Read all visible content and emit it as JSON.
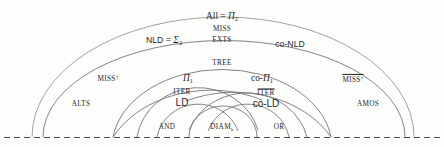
{
  "diagram": {
    "type": "nested-semicircle-hierarchy",
    "baseline_style": "dashed",
    "stroke_color": "#8a8a8a",
    "text_color": "#1f1f1f",
    "background": "#fdfdfc"
  },
  "labels": {
    "all_pi2": "All = Π2",
    "all_pi2_parts": {
      "name": "All",
      "rel": "=",
      "sym": "Π",
      "sub": "2"
    },
    "miss": "MISS",
    "exts": "EXTS",
    "nld_sigma2": "NLD = Σ2",
    "nld_parts": {
      "name": "NLD",
      "rel": "=",
      "sym": "Σ",
      "sub": "2"
    },
    "co_nld": "co-NLD",
    "tree": "TREE",
    "pi1": "Π1",
    "pi1_parts": {
      "sym": "Π",
      "sub": "1"
    },
    "co_pi1": "co-Π1",
    "co_pi1_parts": {
      "prefix": "co-",
      "sym": "Π",
      "sub": "1"
    },
    "miss_dagger": "MISS†",
    "miss_dagger_parts": {
      "base": "MISS",
      "sup": "†"
    },
    "miss_dagger_bar": "MISS† (overlined)",
    "alts": "ALTS",
    "amos": "AMOS",
    "iter": "ITER",
    "ld": "LD",
    "iter_bar": "ITER (overlined)",
    "co_ld": "co-LD",
    "and": "AND",
    "diam_k": "DIAMk",
    "diam_parts": {
      "base": "DIAM",
      "sub": "k"
    },
    "or": "OR"
  },
  "arcs": [
    {
      "name": "all-pi2",
      "cx": 222,
      "left": 32,
      "right": 415,
      "ry": 113
    },
    {
      "name": "nld",
      "cx": 222,
      "left": 42,
      "right": 406,
      "ry": 89
    },
    {
      "name": "co-nld",
      "cx": 222,
      "left": 42,
      "right": 406,
      "ry": 89
    },
    {
      "name": "miss-dag",
      "cx": 178,
      "left": 113,
      "right": 243,
      "ry": 72
    },
    {
      "name": "tree",
      "cx": 222,
      "left": 113,
      "right": 330,
      "ry": 72
    },
    {
      "name": "pi1",
      "cx": 196,
      "left": 137,
      "right": 255,
      "ry": 56
    },
    {
      "name": "co-pi1",
      "cx": 248,
      "left": 190,
      "right": 307,
      "ry": 56
    },
    {
      "name": "iter-ld",
      "cx": 196,
      "left": 157,
      "right": 236,
      "ry": 38
    },
    {
      "name": "iter-cold",
      "cx": 248,
      "left": 209,
      "right": 289,
      "ry": 38
    },
    {
      "name": "diam",
      "cx": 222,
      "left": 188,
      "right": 257,
      "ry": 30
    }
  ]
}
